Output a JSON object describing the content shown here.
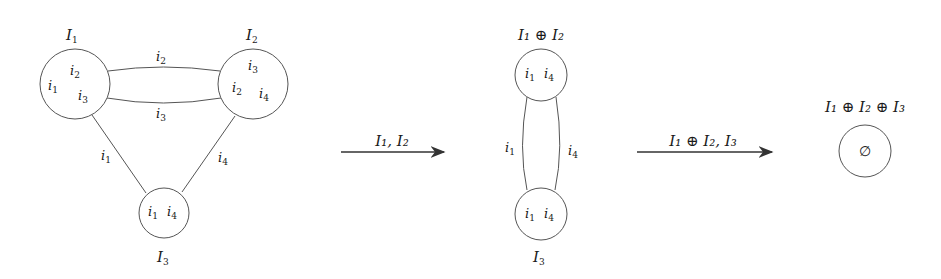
{
  "diagram": {
    "stage1": {
      "nodes": [
        {
          "id": "I1",
          "label": "I",
          "sub": "1",
          "items": [
            {
              "t": "i",
              "s": "2"
            },
            {
              "t": "i",
              "s": "1"
            },
            {
              "t": "i",
              "s": "3"
            }
          ]
        },
        {
          "id": "I2",
          "label": "I",
          "sub": "2",
          "items": [
            {
              "t": "i",
              "s": "3"
            },
            {
              "t": "i",
              "s": "2"
            },
            {
              "t": "i",
              "s": "4"
            }
          ]
        },
        {
          "id": "I3",
          "label": "I",
          "sub": "3",
          "items": [
            {
              "t": "i",
              "s": "1"
            },
            {
              "t": "i",
              "s": "4"
            }
          ]
        }
      ],
      "edges": [
        {
          "from": "I1",
          "to": "I2",
          "label": "i",
          "sub": "2"
        },
        {
          "from": "I1",
          "to": "I2",
          "label": "i",
          "sub": "3"
        },
        {
          "from": "I1",
          "to": "I3",
          "label": "i",
          "sub": "1"
        },
        {
          "from": "I2",
          "to": "I3",
          "label": "i",
          "sub": "4"
        }
      ]
    },
    "arrow1": {
      "label": "I₁, I₂"
    },
    "stage2": {
      "nodes": [
        {
          "id": "I1+I2",
          "label": "I₁ ⊕ I₂",
          "items": [
            {
              "t": "i",
              "s": "1"
            },
            {
              "t": "i",
              "s": "4"
            }
          ]
        },
        {
          "id": "I3",
          "label": "I",
          "sub": "3",
          "items": [
            {
              "t": "i",
              "s": "1"
            },
            {
              "t": "i",
              "s": "4"
            }
          ]
        }
      ],
      "edges": [
        {
          "label": "i",
          "sub": "1"
        },
        {
          "label": "i",
          "sub": "4"
        }
      ]
    },
    "arrow2": {
      "label": "I₁ ⊕ I₂, I₃"
    },
    "stage3": {
      "node": {
        "label": "I₁ ⊕ I₂ ⊕ I₃",
        "content": "∅"
      }
    }
  }
}
